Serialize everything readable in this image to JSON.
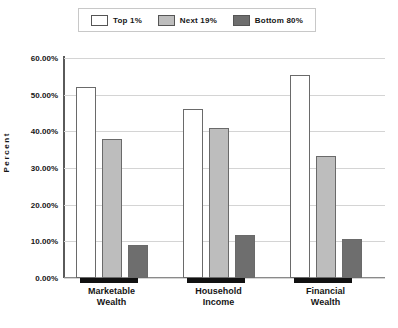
{
  "chart_data": {
    "type": "bar",
    "title": "",
    "xlabel": "",
    "ylabel": "Percent",
    "ylim": [
      0,
      60
    ],
    "grid": true,
    "legend_position": "top",
    "categories": [
      "Marketable Wealth",
      "Household Income",
      "Financial Wealth"
    ],
    "category_lines": [
      [
        "Marketable",
        "Wealth"
      ],
      [
        "Household",
        "Income"
      ],
      [
        "Financial",
        "Wealth"
      ]
    ],
    "ytick_labels": [
      "60.00%",
      "50.00%",
      "40.00%",
      "30.00%",
      "20.00%",
      "10.00%",
      "0.00%"
    ],
    "ytick_values": [
      60,
      50,
      40,
      30,
      20,
      10,
      0
    ],
    "series": [
      {
        "name": "Top 1%",
        "color": "#ffffff",
        "values": [
          52.2,
          46.1,
          55.3
        ]
      },
      {
        "name": "Next 19%",
        "color": "#bdbdbd",
        "values": [
          37.8,
          41.0,
          33.4
        ]
      },
      {
        "name": "Bottom 80%",
        "color": "#6e6e6e",
        "values": [
          9.1,
          11.8,
          10.7
        ]
      }
    ]
  },
  "legend": {
    "items": [
      {
        "label": "Top 1%",
        "color": "#ffffff"
      },
      {
        "label": "Next 19%",
        "color": "#bdbdbd"
      },
      {
        "label": "Bottom 80%",
        "color": "#6e6e6e"
      }
    ]
  },
  "axis": {
    "y_title": "Percent"
  }
}
